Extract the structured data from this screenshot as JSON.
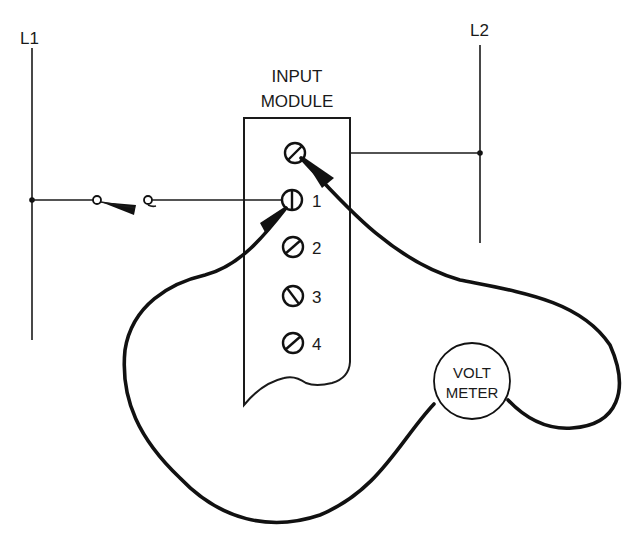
{
  "figure": {
    "type": "wiring-diagram"
  },
  "rails": {
    "l1": {
      "label": "L1"
    },
    "l2": {
      "label": "L2"
    }
  },
  "switch": {
    "name": "input switch",
    "state": "open"
  },
  "module": {
    "title_line1": "INPUT",
    "title_line2": "MODULE",
    "terminals": [
      {
        "id": "common",
        "label": ""
      },
      {
        "id": "1",
        "label": "1"
      },
      {
        "id": "2",
        "label": "2"
      },
      {
        "id": "3",
        "label": "3"
      },
      {
        "id": "4",
        "label": "4"
      }
    ]
  },
  "meter": {
    "line1": "VOLT",
    "line2": "METER"
  },
  "colors": {
    "ink": "#111111",
    "background": "#ffffff"
  }
}
